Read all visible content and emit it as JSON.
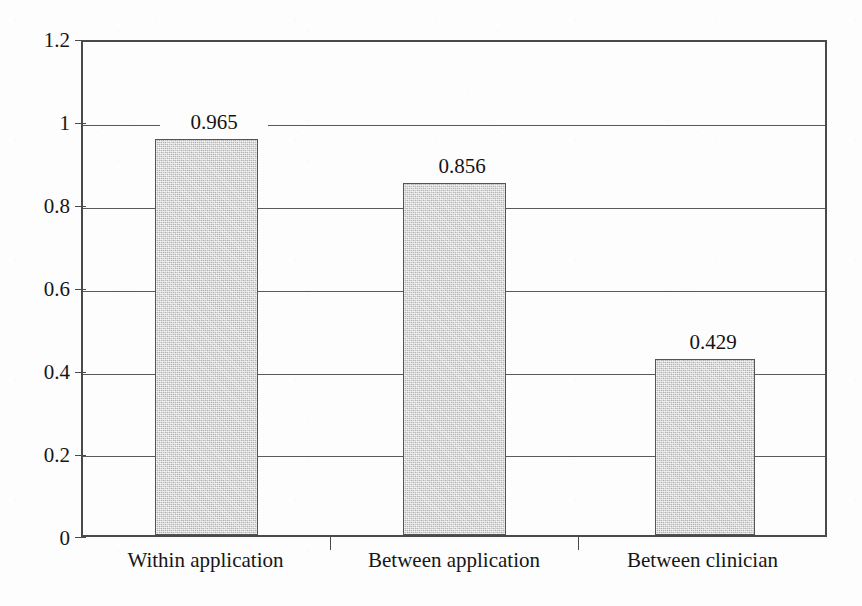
{
  "chart_data": {
    "type": "bar",
    "title": "",
    "subtitle": "",
    "xlabel": "",
    "ylabel": "",
    "categories": [
      "Within application",
      "Between application",
      "Between clinician"
    ],
    "values": [
      0.965,
      0.856,
      0.429
    ],
    "value_labels": [
      "0.965",
      "0.856",
      "0.429"
    ],
    "ylim": [
      0,
      1.2
    ],
    "ytick_values": [
      0,
      0.2,
      0.4,
      0.6,
      0.8,
      1,
      1.2
    ],
    "ytick_labels": [
      "0",
      "0.2",
      "0.4",
      "0.6",
      "0.8",
      "1",
      "1.2"
    ],
    "grid": "horizontal",
    "legend": "none",
    "series": [
      {
        "name": "",
        "values": [
          0.965,
          0.856,
          0.429
        ]
      }
    ],
    "colors": {
      "bar_fill": "#cfcfcf",
      "bar_border": "#555555",
      "axis": "#4a4a4a",
      "gridline": "#5a5a5a",
      "text": "#161616",
      "background": "#fdfdfd"
    }
  }
}
